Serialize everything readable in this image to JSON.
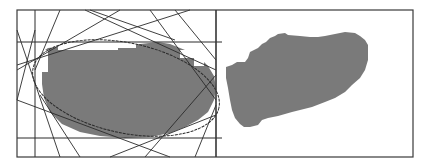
{
  "figure": {
    "frame": {
      "x": 17,
      "y": 10,
      "width": 396,
      "height": 147,
      "stroke": "#3a3a3a"
    },
    "divider_x": 216,
    "colors": {
      "blob_fill": "#7a7a7a",
      "line": "#2a2a2a",
      "background": "#ffffff",
      "highlight": "#d8d8d8"
    },
    "left_panel": {
      "label": "ellipse fit with tangent lines",
      "grid_lines": {
        "vertical": [
          35,
          216
        ],
        "horizontal": [
          42,
          138
        ]
      },
      "ellipse": {
        "cx": 126,
        "cy": 88,
        "rx": 95,
        "ry": 45,
        "rotation": 12
      },
      "tangent_lines": [
        [
          17,
          30,
          60,
          157
        ],
        [
          17,
          70,
          120,
          10
        ],
        [
          17,
          65,
          190,
          10
        ],
        [
          17,
          100,
          35,
          30
        ],
        [
          60,
          10,
          35,
          70
        ],
        [
          90,
          10,
          175,
          40
        ],
        [
          85,
          10,
          216,
          70
        ],
        [
          150,
          10,
          216,
          100
        ],
        [
          175,
          10,
          216,
          60
        ],
        [
          17,
          100,
          170,
          157
        ],
        [
          40,
          95,
          80,
          157
        ],
        [
          110,
          157,
          216,
          115
        ],
        [
          145,
          157,
          216,
          75
        ],
        [
          195,
          157,
          216,
          105
        ]
      ]
    },
    "right_panel": {
      "label": "pixelated region",
      "blob_polygon": "226,67 232,65 237,62 245,62 248,58 250,52 258,48 262,44 266,42 270,38 275,36 278,34 285,33 288,35 300,36 310,37 318,37 325,36 330,35 340,33 345,32 355,33 360,36 365,40 368,45 368,60 365,70 360,78 352,85 345,92 335,98 325,102 312,107 300,110 292,112 285,114 278,116 268,118 262,120 258,125 250,127 244,127 240,124 235,118 232,110 230,100 228,88 226,78"
    }
  }
}
